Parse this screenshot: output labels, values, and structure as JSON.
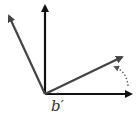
{
  "diagram": {
    "type": "vector-rotation",
    "label": "b′",
    "label_prefix_arrow": "→",
    "colors": {
      "axis": "#111111",
      "vector": "#444444",
      "rotation_hint": "#555555",
      "background": "#ffffff"
    },
    "vectors": [
      {
        "name": "vertical-axis",
        "from": [
          45,
          94
        ],
        "to": [
          45,
          4
        ]
      },
      {
        "name": "horizontal-axis",
        "from": [
          45,
          94
        ],
        "to": [
          133,
          94
        ]
      },
      {
        "name": "rotated-vector",
        "from": [
          45,
          94
        ],
        "to": [
          124,
          56
        ]
      },
      {
        "name": "perpendicular-vector",
        "from": [
          45,
          94
        ],
        "to": [
          8,
          14
        ]
      }
    ],
    "rotation_arrow": {
      "style": "dotted",
      "from": [
        128,
        86
      ],
      "to": [
        114,
        66
      ]
    }
  }
}
